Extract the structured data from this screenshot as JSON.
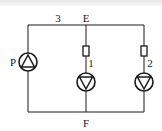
{
  "diagram": {
    "type": "pump-circuit",
    "nodes": {
      "top": "E",
      "bottom": "F"
    },
    "labels": {
      "segment_top": "3",
      "node_e": "E",
      "node_f": "F",
      "pump_main": "P",
      "branch_1": "1",
      "branch_2": "2"
    },
    "components": [
      {
        "id": "P",
        "kind": "pump",
        "direction": "up",
        "branch": "left"
      },
      {
        "id": "1",
        "kind": "pump-with-resistor",
        "direction": "down",
        "branch": "middle"
      },
      {
        "id": "2",
        "kind": "pump-with-resistor",
        "direction": "down",
        "branch": "right"
      }
    ],
    "colors": {
      "line": "#1a1a1a",
      "background": "#ffffff"
    }
  }
}
